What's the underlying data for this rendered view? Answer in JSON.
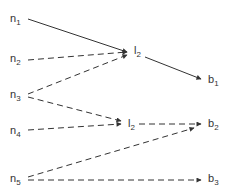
{
  "diagram": {
    "colors": {
      "stroke": "#333333",
      "text": "#333333",
      "background": "#ffffff"
    },
    "nodes": [
      {
        "id": "n1",
        "base": "n",
        "sub": "1",
        "x": 10,
        "y": 13
      },
      {
        "id": "n2",
        "base": "n",
        "sub": "2",
        "x": 10,
        "y": 53
      },
      {
        "id": "n3",
        "base": "n",
        "sub": "3",
        "x": 10,
        "y": 89
      },
      {
        "id": "n4",
        "base": "n",
        "sub": "4",
        "x": 10,
        "y": 125
      },
      {
        "id": "n5",
        "base": "n",
        "sub": "5",
        "x": 10,
        "y": 173
      },
      {
        "id": "l2a",
        "base": "l",
        "sub": "2",
        "x": 134,
        "y": 45
      },
      {
        "id": "l2b",
        "base": "l",
        "sub": "2",
        "x": 128,
        "y": 118
      },
      {
        "id": "b1",
        "base": "b",
        "sub": "1",
        "x": 208,
        "y": 74
      },
      {
        "id": "b2",
        "base": "b",
        "sub": "2",
        "x": 208,
        "y": 118
      },
      {
        "id": "b3",
        "base": "b",
        "sub": "3",
        "x": 208,
        "y": 173
      }
    ],
    "edges": [
      {
        "from": "n1",
        "to": "l2a",
        "style": "solid",
        "x1": 28,
        "y1": 19,
        "x2": 127,
        "y2": 52
      },
      {
        "from": "n2",
        "to": "l2a",
        "style": "dashed",
        "x1": 28,
        "y1": 60,
        "x2": 127,
        "y2": 52
      },
      {
        "from": "n3",
        "to": "l2a",
        "style": "dashed",
        "x1": 28,
        "y1": 94,
        "x2": 127,
        "y2": 55
      },
      {
        "from": "n3",
        "to": "l2b",
        "style": "dashed",
        "x1": 28,
        "y1": 97,
        "x2": 121,
        "y2": 121
      },
      {
        "from": "n4",
        "to": "l2b",
        "style": "dashed",
        "x1": 28,
        "y1": 130,
        "x2": 121,
        "y2": 124
      },
      {
        "from": "l2a",
        "to": "b1",
        "style": "solid",
        "x1": 145,
        "y1": 57,
        "x2": 201,
        "y2": 79
      },
      {
        "from": "l2b",
        "to": "b2",
        "style": "dashed",
        "x1": 139,
        "y1": 124,
        "x2": 201,
        "y2": 124
      },
      {
        "from": "n5",
        "to": "b2",
        "style": "dashed",
        "x1": 28,
        "y1": 177,
        "x2": 194,
        "y2": 128
      },
      {
        "from": "n5",
        "to": "b3",
        "style": "dashed",
        "x1": 28,
        "y1": 180,
        "x2": 201,
        "y2": 180
      }
    ]
  }
}
